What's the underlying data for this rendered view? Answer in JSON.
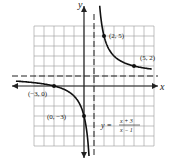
{
  "chart_data": {
    "type": "line",
    "title": "",
    "xlabel": "x",
    "ylabel": "y",
    "function_label": {
      "lhs": "y =",
      "num": "x + 3",
      "den": "x − 1"
    },
    "asymptotes": {
      "vertical": 1,
      "horizontal": 1
    },
    "points": [
      {
        "x": -3,
        "y": 0,
        "label": "(−3, 0)"
      },
      {
        "x": 0,
        "y": -3,
        "label": "(0, −3)"
      },
      {
        "x": 2,
        "y": 5,
        "label": "(2, 5)"
      },
      {
        "x": 5,
        "y": 2,
        "label": "(5, 2)"
      }
    ],
    "xlim": [
      -5,
      7
    ],
    "ylim": [
      -6,
      6
    ],
    "grid": true
  }
}
